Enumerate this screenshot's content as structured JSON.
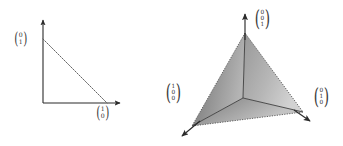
{
  "figure": {
    "caption": "",
    "background_color": "#ffffff",
    "ink_color": "#2b2b2b"
  },
  "left_panel": {
    "name": "2d-simplex",
    "axes": {
      "origin": [
        43,
        103
      ],
      "x_axis_end": [
        123,
        103
      ],
      "y_axis_end": [
        43,
        18
      ],
      "arrowheads": [
        "x-axis-arrow",
        "y-axis-arrow"
      ]
    },
    "hypotenuse": {
      "style": "dashed",
      "from": [
        43,
        39
      ],
      "to": [
        107,
        103
      ]
    },
    "labels": [
      {
        "name": "vertex-label-01",
        "entries": [
          "0",
          "1"
        ],
        "x": 14,
        "y": 33
      },
      {
        "name": "vertex-label-10",
        "entries": [
          "1",
          "0"
        ],
        "x": 95,
        "y": 107
      }
    ]
  },
  "right_panel": {
    "name": "3d-simplex",
    "triangle": {
      "apex": [
        245,
        33
      ],
      "bottom_left": [
        192,
        126
      ],
      "bottom_right": [
        303,
        112
      ],
      "center": [
        243,
        98
      ],
      "edge_style": "dotted",
      "fill_colors": [
        "#8f8f8f",
        "#a8a8a8",
        "#bdbdbd"
      ]
    },
    "axes": {
      "z_axis_end": [
        245,
        11
      ],
      "x_axis_end": [
        180,
        139
      ],
      "y_axis_end": [
        312,
        123
      ],
      "arrowheads": [
        "z-axis-arrow",
        "x-axis-arrow",
        "y-axis-arrow"
      ]
    },
    "labels": [
      {
        "name": "vertex-label-001",
        "entries": [
          "0",
          "0",
          "1"
        ],
        "x": 254,
        "y": 12
      },
      {
        "name": "vertex-label-100",
        "entries": [
          "1",
          "0",
          "0"
        ],
        "x": 165,
        "y": 86
      },
      {
        "name": "vertex-label-010",
        "entries": [
          "0",
          "1",
          "0"
        ],
        "x": 313,
        "y": 90
      }
    ]
  },
  "glyphs": {
    "paren_open": "(",
    "paren_close": ")"
  }
}
